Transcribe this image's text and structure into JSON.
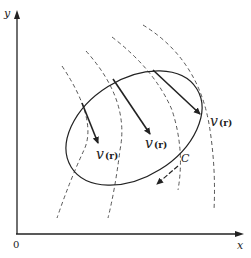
{
  "figure": {
    "axes": {
      "y_label": "y",
      "x_label": "x",
      "origin_label": "0"
    },
    "vector_labels": [
      {
        "symbol": "v",
        "arg": "(r)"
      },
      {
        "symbol": "v",
        "arg": "(r)"
      },
      {
        "symbol": "v",
        "arg": "(r)"
      }
    ],
    "contour_label": "C",
    "colors": {
      "stroke": "#222222",
      "dashed": "#444444",
      "background": "#ffffff"
    }
  }
}
